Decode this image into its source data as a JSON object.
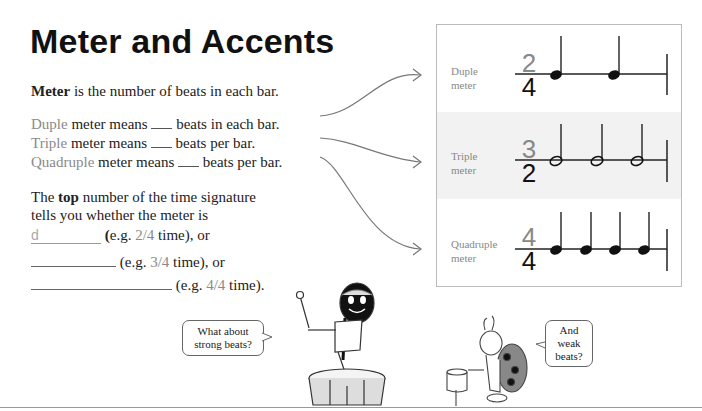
{
  "title": "Meter and Accents",
  "intro": {
    "bold": "Meter",
    "rest": " is the number of beats in each bar."
  },
  "meter_lines": [
    {
      "type": "Duple",
      "text1": " meter means ",
      "text2": " beats in each bar."
    },
    {
      "type": "Triple",
      "text1": " meter means ",
      "text2": " beats per bar."
    },
    {
      "type": "Quadruple",
      "text1": " meter means ",
      "text2": " beats per bar."
    }
  ],
  "top_number": {
    "line1_a": "The ",
    "line1_bold": "top",
    "line1_b": " number of the time signature",
    "line2": "tells you whether the meter is"
  },
  "answers": [
    {
      "value": "d",
      "paren_open": "(",
      "example": "e.g. ",
      "sig": "2/4",
      "rest": " time), or"
    },
    {
      "value": "",
      "paren_open": "(",
      "example": "e.g. ",
      "sig": "3/4",
      "rest": " time), or"
    },
    {
      "value": "",
      "paren_open": "(",
      "example": "e.g. ",
      "sig": "4/4",
      "rest": " time)."
    }
  ],
  "examples_box": {
    "rows": [
      {
        "label1": "Duple",
        "label2": "meter",
        "top": "2",
        "bottom": "4",
        "notes": 2,
        "note_type": "quarter"
      },
      {
        "label1": "Triple",
        "label2": "meter",
        "top": "3",
        "bottom": "2",
        "notes": 3,
        "note_type": "half"
      },
      {
        "label1": "Quadruple",
        "label2": "meter",
        "top": "4",
        "bottom": "4",
        "notes": 4,
        "note_type": "quarter"
      }
    ]
  },
  "bubbles": {
    "drummer": {
      "line1": "What about",
      "line2": "strong beats?"
    },
    "ladybug": {
      "line1": "And",
      "line2": "weak",
      "line3": "beats?"
    }
  }
}
